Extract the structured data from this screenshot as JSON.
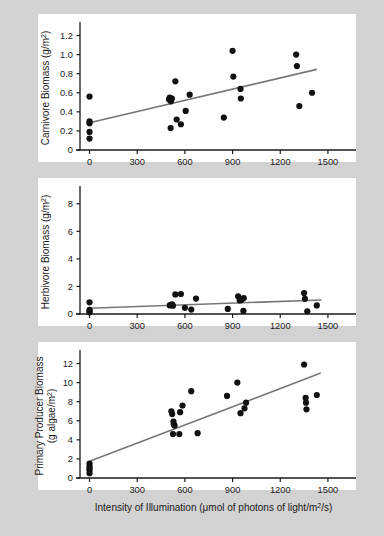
{
  "figure": {
    "background_color": "#d2d2d2",
    "panel_color": "#ffffff",
    "point_color": "#111111",
    "line_color": "#777777",
    "axis_color": "#1a1a1a"
  },
  "xlabel": "Intensity of Illumination (μmol of photons of light/m²/s)",
  "xlabel_parts": {
    "pre": "Intensity of Illumination (",
    "mu": "μ",
    "mid": "mol of photons of light/m",
    "sup": "2",
    "post": "/s)"
  },
  "x_ticks": [
    "0",
    "300",
    "600",
    "900",
    "1200",
    "1500"
  ],
  "x_tick_values": [
    0,
    300,
    600,
    900,
    1200,
    1500
  ],
  "chart_data": [
    {
      "type": "scatter",
      "panel": "a",
      "title": "",
      "xlabel": "",
      "ylabel": "Carnivore Biomass (g/m²)",
      "ylabel_parts": {
        "pre": "Carnivore Biomass (g/m",
        "sup": "2",
        "post": ")"
      },
      "xlim": [
        -60,
        1620
      ],
      "ylim": [
        0,
        1.3
      ],
      "x_ticks": [
        0,
        300,
        600,
        900,
        1200,
        1500
      ],
      "y_ticks": [
        0,
        0.2,
        0.4,
        0.6,
        0.8,
        1.0,
        1.2
      ],
      "y_tick_labels": [
        "0",
        "0.2",
        "0.4",
        "0.6",
        "0.8",
        "1.0",
        "1.2"
      ],
      "grid": false,
      "legend": "none",
      "points": [
        [
          0,
          0.56
        ],
        [
          0,
          0.3
        ],
        [
          0,
          0.28
        ],
        [
          0,
          0.19
        ],
        [
          0,
          0.12
        ],
        [
          500,
          0.53
        ],
        [
          505,
          0.55
        ],
        [
          512,
          0.51
        ],
        [
          518,
          0.54
        ],
        [
          510,
          0.23
        ],
        [
          540,
          0.72
        ],
        [
          548,
          0.32
        ],
        [
          575,
          0.27
        ],
        [
          605,
          0.41
        ],
        [
          630,
          0.58
        ],
        [
          845,
          0.34
        ],
        [
          900,
          1.04
        ],
        [
          905,
          0.77
        ],
        [
          950,
          0.64
        ],
        [
          952,
          0.54
        ],
        [
          1300,
          1.0
        ],
        [
          1305,
          0.88
        ],
        [
          1320,
          0.46
        ],
        [
          1400,
          0.6
        ]
      ],
      "trend_line": {
        "x1": 0,
        "y1": 0.285,
        "x2": 1430,
        "y2": 0.845
      }
    },
    {
      "type": "scatter",
      "panel": "b",
      "title": "",
      "xlabel": "",
      "ylabel": "Herbivore Biomass (g/m²)",
      "ylabel_parts": {
        "pre": "Herbivore Biomass (g/m",
        "sup": "2",
        "post": ")"
      },
      "xlim": [
        -60,
        1620
      ],
      "ylim": [
        0,
        9
      ],
      "x_ticks": [
        0,
        300,
        600,
        900,
        1200,
        1500
      ],
      "y_ticks": [
        0,
        2,
        4,
        6,
        8
      ],
      "y_tick_labels": [
        "0",
        "2",
        "4",
        "6",
        "8"
      ],
      "grid": false,
      "legend": "none",
      "points": [
        [
          0,
          0.85
        ],
        [
          0,
          0.3
        ],
        [
          0,
          0.2
        ],
        [
          0,
          0.12
        ],
        [
          505,
          0.62
        ],
        [
          512,
          0.66
        ],
        [
          520,
          0.7
        ],
        [
          525,
          0.6
        ],
        [
          540,
          1.42
        ],
        [
          575,
          1.45
        ],
        [
          600,
          0.45
        ],
        [
          640,
          0.32
        ],
        [
          670,
          1.12
        ],
        [
          870,
          0.37
        ],
        [
          935,
          1.28
        ],
        [
          945,
          0.98
        ],
        [
          955,
          1.02
        ],
        [
          970,
          1.15
        ],
        [
          968,
          0.22
        ],
        [
          1350,
          1.52
        ],
        [
          1355,
          1.1
        ],
        [
          1370,
          0.2
        ],
        [
          1430,
          0.62
        ]
      ],
      "trend_line": {
        "x1": 0,
        "y1": 0.42,
        "x2": 1460,
        "y2": 1.02
      }
    },
    {
      "type": "scatter",
      "panel": "c",
      "title": "",
      "xlabel": "Intensity of Illumination (μmol of photons of light/m²/s)",
      "ylabel": "Primary Producer Biomass (g algae/m²)",
      "ylabel_parts": {
        "line1": "Primary Producer Biomass",
        "pre2": "(g algae/m",
        "sup": "2",
        "post": ")"
      },
      "xlim": [
        -60,
        1620
      ],
      "ylim": [
        0,
        13
      ],
      "x_ticks": [
        0,
        300,
        600,
        900,
        1200,
        1500
      ],
      "y_ticks": [
        0,
        2,
        4,
        6,
        8,
        10,
        12
      ],
      "y_tick_labels": [
        "0",
        "2",
        "4",
        "6",
        "8",
        "10",
        "12"
      ],
      "grid": false,
      "legend": "none",
      "points": [
        [
          0,
          1.5
        ],
        [
          0,
          1.2
        ],
        [
          0,
          1.0
        ],
        [
          0,
          0.8
        ],
        [
          0,
          0.5
        ],
        [
          515,
          7.0
        ],
        [
          520,
          6.7
        ],
        [
          528,
          5.9
        ],
        [
          530,
          5.6
        ],
        [
          535,
          5.5
        ],
        [
          525,
          4.6
        ],
        [
          565,
          4.6
        ],
        [
          570,
          6.9
        ],
        [
          585,
          7.6
        ],
        [
          640,
          9.1
        ],
        [
          680,
          4.7
        ],
        [
          865,
          8.6
        ],
        [
          930,
          10.0
        ],
        [
          950,
          6.8
        ],
        [
          975,
          7.3
        ],
        [
          985,
          7.9
        ],
        [
          1350,
          11.9
        ],
        [
          1360,
          8.4
        ],
        [
          1362,
          7.9
        ],
        [
          1365,
          7.2
        ],
        [
          1430,
          8.7
        ]
      ],
      "trend_line": {
        "x1": 0,
        "y1": 1.75,
        "x2": 1455,
        "y2": 11.0
      }
    }
  ]
}
